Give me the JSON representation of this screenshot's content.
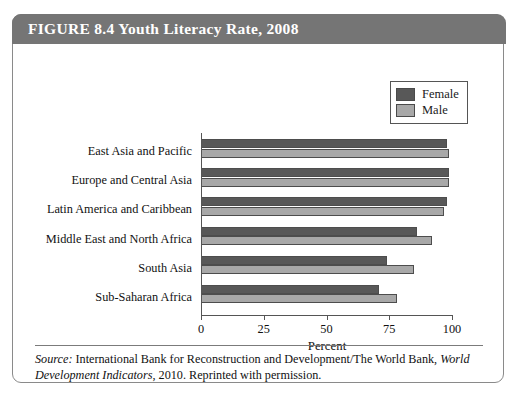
{
  "figure": {
    "title": "FIGURE 8.4  Youth Literacy Rate, 2008",
    "source_prefix": "Source:",
    "source_text_1": " International Bank for Reconstruction and Development/The World Bank, ",
    "source_italic": "World Development Indicators",
    "source_text_2": ", 2010. Reprinted with permission."
  },
  "legend": {
    "position": "top-right",
    "entries": [
      {
        "label": "Female",
        "color": "#585858"
      },
      {
        "label": "Male",
        "color": "#a8a8a8"
      }
    ]
  },
  "axis": {
    "x_title": "Percent",
    "ticks": [
      "0",
      "25",
      "50",
      "75",
      "100"
    ]
  },
  "chart_data": {
    "type": "bar",
    "orientation": "horizontal",
    "title": "Youth Literacy Rate, 2008",
    "xlabel": "Percent",
    "ylabel": "",
    "xlim": [
      0,
      100
    ],
    "xticks": [
      0,
      25,
      50,
      75,
      100
    ],
    "grid": false,
    "legend_position": "top-right",
    "categories": [
      "East Asia and Pacific",
      "Europe and Central Asia",
      "Latin America and Caribbean",
      "Middle East and North Africa",
      "South Asia",
      "Sub-Saharan Africa"
    ],
    "series": [
      {
        "name": "Female",
        "color": "#585858",
        "values": [
          98,
          99,
          98,
          86,
          74,
          71
        ]
      },
      {
        "name": "Male",
        "color": "#a8a8a8",
        "values": [
          99,
          99,
          97,
          92,
          85,
          78
        ]
      }
    ]
  }
}
